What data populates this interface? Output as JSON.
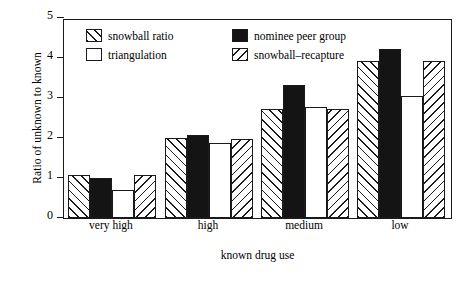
{
  "chart_data": {
    "type": "bar",
    "title": "",
    "xlabel": "known drug use",
    "ylabel": "Ratio of unknown to known",
    "ylim": [
      0,
      5
    ],
    "yticks": [
      "0",
      "1",
      "2",
      "3",
      "4",
      "5"
    ],
    "grid": false,
    "legend_position": "upper-left-inside",
    "categories": [
      "Township A",
      "Township B",
      "Township C",
      "Township D"
    ],
    "category_sublabels": [
      "very high",
      "high",
      "medium",
      "low"
    ],
    "series": [
      {
        "name": "snowball ratio",
        "fill": "forward-hatch",
        "values": [
          1.07,
          2.0,
          2.73,
          3.93
        ]
      },
      {
        "name": "nominee peer group",
        "fill": "solid-black",
        "values": [
          1.0,
          2.08,
          3.32,
          4.23
        ]
      },
      {
        "name": "triangulation",
        "fill": "white",
        "values": [
          0.7,
          1.88,
          2.77,
          3.04
        ]
      },
      {
        "name": "snowball–recapture",
        "fill": "backward-hatch",
        "values": [
          1.07,
          1.98,
          2.73,
          3.93
        ]
      }
    ]
  },
  "legend": {
    "items": [
      {
        "label": "snowball ratio",
        "swatch": "forward-hatch-swatch"
      },
      {
        "label": "nominee peer group",
        "swatch": "solid-black-swatch"
      },
      {
        "label": "triangulation",
        "swatch": "white-swatch"
      },
      {
        "label": "snowball–recapture",
        "swatch": "backward-hatch-swatch"
      }
    ]
  },
  "colors": {
    "axis": "#1a1a1a",
    "bar_outline": "#1a1a1a",
    "solid_fill": "#141414",
    "background": "#ffffff"
  }
}
